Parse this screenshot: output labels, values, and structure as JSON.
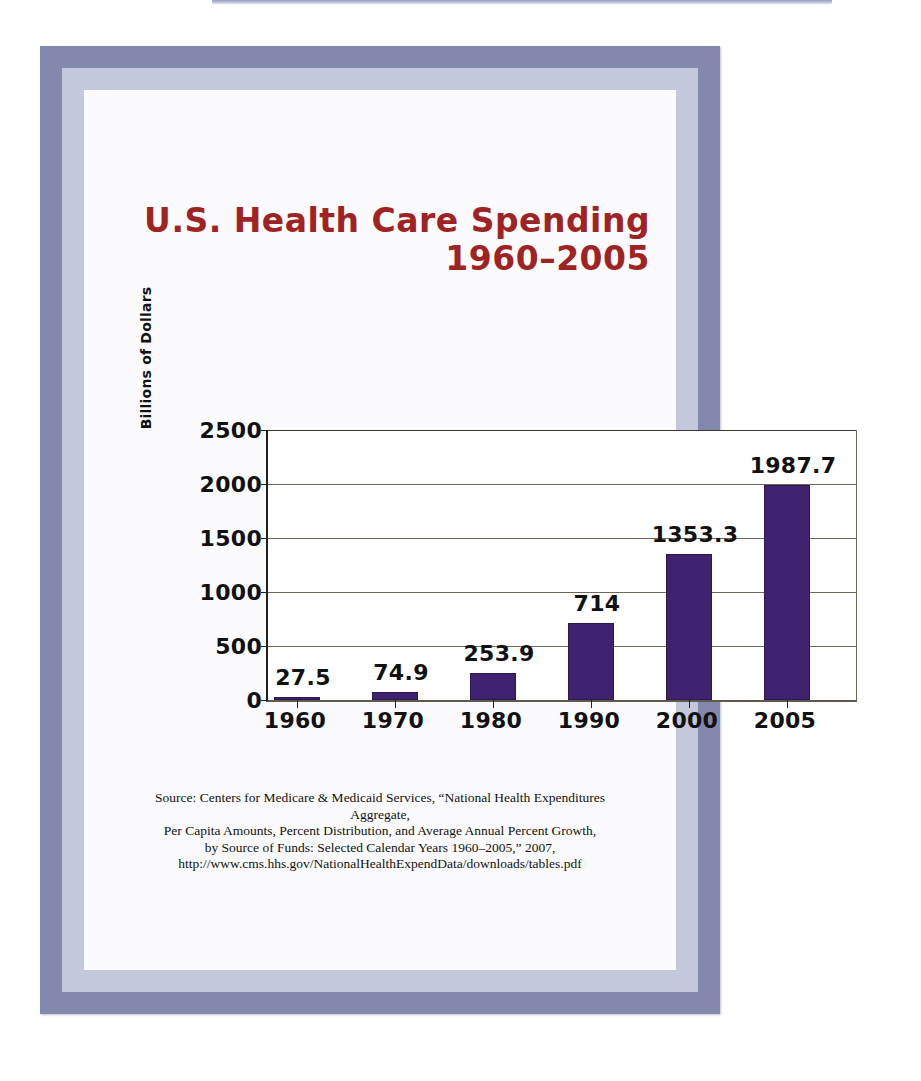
{
  "figure": {
    "title": "U.S. Health Care Spending\n1960–2005",
    "title_color": "#a02323",
    "frame_outer_color": "#8289ad",
    "frame_inner_color": "#c4c8dc",
    "paper_color": "#fbfbfd"
  },
  "source_note": "Source: Centers for Medicare & Medicaid Services, “National Health Expenditures Aggregate,\nPer Capita Amounts, Percent Distribution, and Average Annual Percent Growth,\nby Source of Funds: Selected Calendar Years 1960–2005,” 2007,\nhttp://www.cms.hhs.gov/NationalHealthExpendData/downloads/tables.pdf",
  "chart_data": {
    "type": "bar",
    "title": "U.S. Health Care Spending 1960–2005",
    "subtitle": "",
    "xlabel": "",
    "ylabel": "Billions of Dollars",
    "categories": [
      "1960",
      "1970",
      "1980",
      "1990",
      "2000",
      "2005"
    ],
    "values": [
      27.5,
      74.9,
      253.9,
      714,
      1353.3,
      1987.7
    ],
    "value_labels": [
      "27.5",
      "74.9",
      "253.9",
      "714",
      "1353.3",
      "1987.7"
    ],
    "ylim": [
      0,
      2500
    ],
    "yticks": [
      0,
      500,
      1000,
      1500,
      2000,
      2500
    ],
    "ytick_labels": [
      "0",
      "500",
      "1000",
      "1500",
      "2000",
      "2500"
    ],
    "grid": true,
    "legend": "none",
    "bar_color": "#3f2270",
    "units": "Billions of Dollars"
  }
}
